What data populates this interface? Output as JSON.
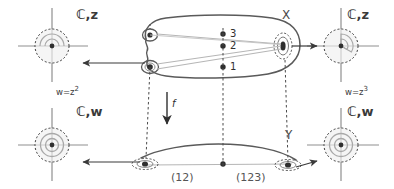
{
  "figure": {
    "colors": {
      "ink": "#3a3a3a",
      "curve": "#555555",
      "light_line": "#b6b6b6",
      "dash": "#4a4a4a",
      "faint": "#cfcfcf",
      "background": "#ffffff"
    }
  },
  "panels": {
    "top_left": {
      "plane_label": "ℂ,z",
      "formula": "w=z",
      "formula_exp": "2"
    },
    "top_right": {
      "plane_label": "ℂ,z",
      "formula": "w=z",
      "formula_exp": "3"
    },
    "bottom_left": {
      "plane_label": "ℂ,w"
    },
    "bottom_right": {
      "plane_label": "ℂ,w"
    }
  },
  "surfaces": {
    "upper": {
      "label": "X",
      "sheet_points": [
        {
          "label": "1"
        },
        {
          "label": "2"
        },
        {
          "label": "3"
        }
      ]
    },
    "lower": {
      "label": "Y",
      "monodromy": [
        {
          "label": "(12)"
        },
        {
          "label": "(123)"
        }
      ]
    }
  },
  "map": {
    "label": "f"
  },
  "footer": {
    "text": ""
  }
}
